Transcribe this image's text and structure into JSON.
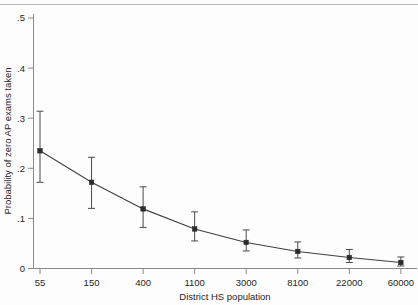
{
  "chart_data": {
    "type": "line",
    "title": "",
    "subtitle": "",
    "xlabel": "District HS population",
    "ylabel": "Probability of zero AP exams taken",
    "categories": [
      "55",
      "150",
      "400",
      "1100",
      "3000",
      "8100",
      "22000",
      "60000"
    ],
    "x_tick_labels": [
      "55",
      "150",
      "400",
      "1100",
      "3000",
      "8100",
      "22000",
      "60000"
    ],
    "y_tick_labels": [
      "0",
      ".1",
      ".2",
      ".3",
      ".4",
      ".5"
    ],
    "y_tick_values": [
      0,
      0.1,
      0.2,
      0.3,
      0.4,
      0.5
    ],
    "ylim": [
      0,
      0.5
    ],
    "grid": false,
    "legend": "none",
    "series": [
      {
        "name": "Probability of zero AP exams taken",
        "values": [
          0.235,
          0.172,
          0.119,
          0.079,
          0.052,
          0.034,
          0.022,
          0.012
        ],
        "ci_lower": [
          0.172,
          0.12,
          0.082,
          0.055,
          0.035,
          0.021,
          0.012,
          0.005
        ],
        "ci_upper": [
          0.314,
          0.222,
          0.163,
          0.113,
          0.077,
          0.053,
          0.038,
          0.023
        ],
        "marker": "filled-square",
        "line_color": "#404040",
        "marker_color": "#2b2b2b",
        "error_bar_color": "#4a4a4a"
      }
    ]
  },
  "axes": {
    "x_axis_name": "x-axis",
    "y_axis_name": "y-axis"
  },
  "colors": {
    "background": "#fdfdfd",
    "axis": "#8a8a8a",
    "text": "#262626",
    "line": "#404040",
    "marker": "#2b2b2b",
    "error": "#4a4a4a",
    "rule": "#b8b8b8"
  }
}
